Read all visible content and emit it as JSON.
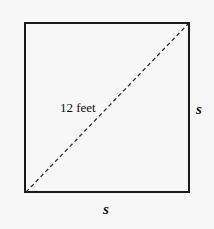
{
  "diagram": {
    "shape": "square",
    "diagonal_label": "12 feet",
    "side_right_label": "s",
    "side_bottom_label": "s",
    "colors": {
      "stroke": "#1a1a1a",
      "background": "#f7f7f7"
    }
  }
}
